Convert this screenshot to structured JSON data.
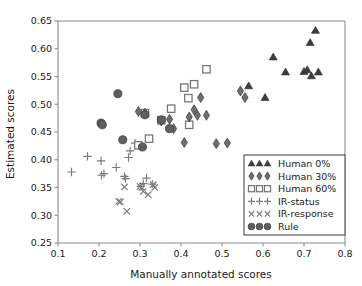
{
  "chart_data": {
    "type": "scatter",
    "title": "",
    "xlabel": "Manually annotated scores",
    "ylabel": "Estimated scores",
    "xlim": [
      0.1,
      0.8
    ],
    "ylim": [
      0.25,
      0.65
    ],
    "xticks": [
      "0.1",
      "0.2",
      "0.3",
      "0.4",
      "0.5",
      "0.6",
      "0.7",
      "0.8"
    ],
    "xtick_values": [
      0.1,
      0.2,
      0.3,
      0.4,
      0.5,
      0.6,
      0.7,
      0.8
    ],
    "yticks": [
      "0.25",
      "0.30",
      "0.35",
      "0.40",
      "0.45",
      "0.50",
      "0.55",
      "0.60",
      "0.65"
    ],
    "ytick_values": [
      0.25,
      0.3,
      0.35,
      0.4,
      0.45,
      0.5,
      0.55,
      0.6,
      0.65
    ],
    "grid": false,
    "legend_position": "lower right",
    "series": [
      {
        "name": "Human 0%",
        "marker": "triangle",
        "color": "#3d3d3d",
        "points": [
          [
            0.565,
            0.533
          ],
          [
            0.605,
            0.512
          ],
          [
            0.625,
            0.585
          ],
          [
            0.655,
            0.558
          ],
          [
            0.7,
            0.559
          ],
          [
            0.708,
            0.562
          ],
          [
            0.715,
            0.611
          ],
          [
            0.718,
            0.551
          ],
          [
            0.728,
            0.633
          ],
          [
            0.735,
            0.558
          ]
        ]
      },
      {
        "name": "Human 30%",
        "marker": "diamond",
        "color": "#6e6e6e",
        "points": [
          [
            0.296,
            0.487
          ],
          [
            0.312,
            0.484
          ],
          [
            0.352,
            0.47
          ],
          [
            0.372,
            0.473
          ],
          [
            0.382,
            0.456
          ],
          [
            0.408,
            0.431
          ],
          [
            0.42,
            0.477
          ],
          [
            0.432,
            0.49
          ],
          [
            0.44,
            0.48
          ],
          [
            0.448,
            0.512
          ],
          [
            0.462,
            0.48
          ],
          [
            0.486,
            0.429
          ],
          [
            0.513,
            0.43
          ],
          [
            0.545,
            0.524
          ],
          [
            0.556,
            0.512
          ],
          [
            0.57,
            0.384
          ]
        ]
      },
      {
        "name": "Human 60%",
        "marker": "square",
        "color": "#747474",
        "points": [
          [
            0.296,
            0.426
          ],
          [
            0.312,
            0.484
          ],
          [
            0.322,
            0.438
          ],
          [
            0.352,
            0.471
          ],
          [
            0.376,
            0.492
          ],
          [
            0.408,
            0.53
          ],
          [
            0.418,
            0.511
          ],
          [
            0.42,
            0.463
          ],
          [
            0.432,
            0.536
          ],
          [
            0.462,
            0.563
          ]
        ]
      },
      {
        "name": "IR-status",
        "marker": "plus",
        "color": "#7a7a7a",
        "points": [
          [
            0.133,
            0.378
          ],
          [
            0.172,
            0.406
          ],
          [
            0.205,
            0.398
          ],
          [
            0.206,
            0.372
          ],
          [
            0.212,
            0.375
          ],
          [
            0.242,
            0.386
          ],
          [
            0.262,
            0.37
          ],
          [
            0.265,
            0.366
          ],
          [
            0.272,
            0.404
          ],
          [
            0.276,
            0.416
          ],
          [
            0.288,
            0.43
          ],
          [
            0.302,
            0.352
          ],
          [
            0.308,
            0.357
          ],
          [
            0.316,
            0.367
          ],
          [
            0.33,
            0.356
          ]
        ]
      },
      {
        "name": "IR-response",
        "marker": "cross",
        "color": "#7a7a7a",
        "points": [
          [
            0.248,
            0.325
          ],
          [
            0.252,
            0.324
          ],
          [
            0.262,
            0.351
          ],
          [
            0.268,
            0.307
          ],
          [
            0.3,
            0.352
          ],
          [
            0.304,
            0.35
          ],
          [
            0.308,
            0.343
          ],
          [
            0.32,
            0.337
          ],
          [
            0.332,
            0.355
          ],
          [
            0.336,
            0.35
          ]
        ]
      },
      {
        "name": "Rule",
        "marker": "circle",
        "color": "#5e5e5e",
        "points": [
          [
            0.205,
            0.466
          ],
          [
            0.208,
            0.463
          ],
          [
            0.246,
            0.519
          ],
          [
            0.258,
            0.436
          ],
          [
            0.306,
            0.423
          ],
          [
            0.312,
            0.481
          ],
          [
            0.352,
            0.472
          ],
          [
            0.372,
            0.456
          ]
        ]
      }
    ]
  },
  "legend": {
    "entries": [
      {
        "label": "Human 0%",
        "marker": "triangle"
      },
      {
        "label": "Human 30%",
        "marker": "diamond"
      },
      {
        "label": "Human 60%",
        "marker": "square"
      },
      {
        "label": "IR-status",
        "marker": "plus"
      },
      {
        "label": "IR-response",
        "marker": "cross"
      },
      {
        "label": "Rule",
        "marker": "circle"
      }
    ]
  },
  "colors": {
    "axis": "#8c8c8c",
    "text": "#1a1a1a",
    "legend_border": "#4d4d4d",
    "background": "#ffffff"
  }
}
